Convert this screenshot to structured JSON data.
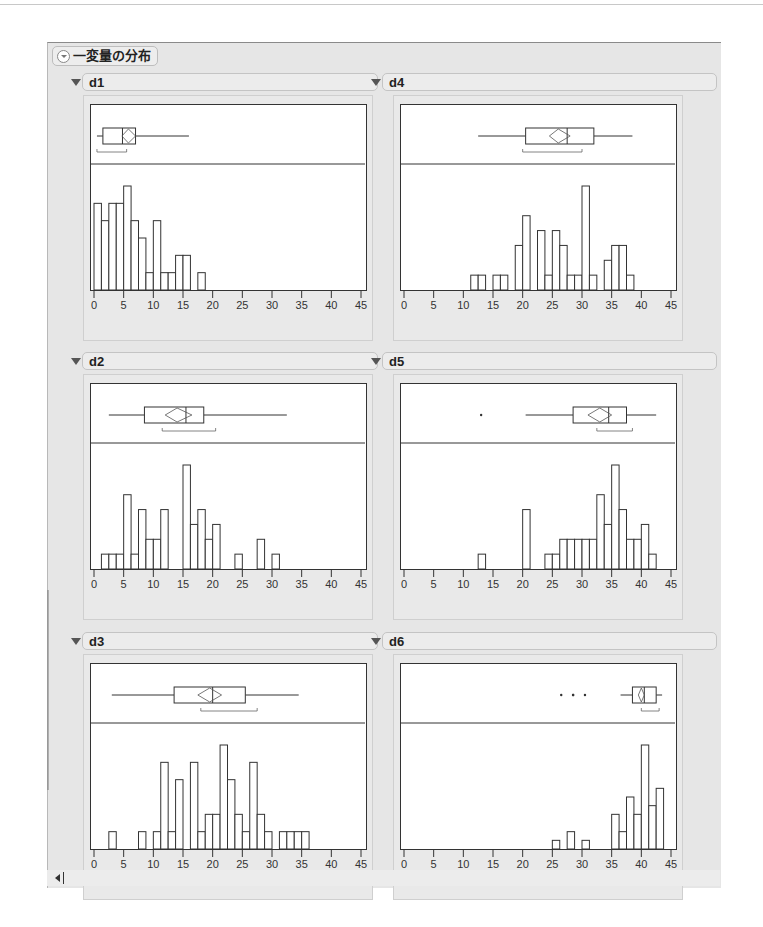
{
  "report": {
    "title": "一変量の分布"
  },
  "panels": [
    {
      "name": "d1",
      "col": 0,
      "row": 0
    },
    {
      "name": "d4",
      "col": 1,
      "row": 0
    },
    {
      "name": "d2",
      "col": 0,
      "row": 1
    },
    {
      "name": "d5",
      "col": 1,
      "row": 1
    },
    {
      "name": "d3",
      "col": 0,
      "row": 2
    },
    {
      "name": "d6",
      "col": 1,
      "row": 2
    }
  ],
  "chart_data": [
    {
      "type": "bar",
      "title": "d1",
      "xlabel": "",
      "ylabel": "",
      "xlim": [
        0,
        45
      ],
      "x_ticks": [
        0,
        5,
        10,
        15,
        20,
        25,
        30,
        35,
        40,
        45
      ],
      "bin_width": 1.25,
      "bin_start": 0,
      "values": [
        5,
        4,
        5,
        5,
        6,
        4,
        3,
        1,
        4,
        1,
        1,
        2,
        2,
        0,
        1
      ],
      "boxplot": {
        "min": 0.5,
        "q1": 1.5,
        "median": 4.8,
        "q3": 7.0,
        "max": 16,
        "mean": 5.8,
        "mean_ci": [
          4.7,
          7.0
        ],
        "shortest_half": [
          0.5,
          5.5
        ],
        "outliers": []
      },
      "grid": false,
      "legend": null
    },
    {
      "type": "bar",
      "title": "d4",
      "xlim": [
        0,
        45
      ],
      "x_ticks": [
        0,
        5,
        10,
        15,
        20,
        25,
        30,
        35,
        40,
        45
      ],
      "bin_width": 1.25,
      "bin_start": 11.25,
      "values": [
        1,
        1,
        0,
        1,
        1,
        0,
        3,
        5,
        0,
        4,
        1,
        4,
        3,
        1,
        1,
        7,
        1,
        0,
        2,
        3,
        3,
        1
      ],
      "boxplot": {
        "min": 12.5,
        "q1": 20.5,
        "median": 27.5,
        "q3": 32.0,
        "max": 38.5,
        "mean": 26.0,
        "mean_ci": [
          24.5,
          28.0
        ],
        "shortest_half": [
          20.0,
          30.0
        ],
        "outliers": []
      },
      "grid": false,
      "legend": null
    },
    {
      "type": "bar",
      "title": "d2",
      "xlim": [
        0,
        45
      ],
      "x_ticks": [
        0,
        5,
        10,
        15,
        20,
        25,
        30,
        35,
        40,
        45
      ],
      "bin_width": 1.25,
      "bin_start": 1.25,
      "values": [
        1,
        1,
        1,
        5,
        1,
        4,
        2,
        2,
        4,
        0,
        0,
        7,
        3,
        4,
        2,
        3,
        0,
        0,
        1,
        0,
        0,
        2,
        0,
        1
      ],
      "boxplot": {
        "min": 2.5,
        "q1": 8.5,
        "median": 15.5,
        "q3": 18.5,
        "max": 32.5,
        "mean": 14.0,
        "mean_ci": [
          12.0,
          16.5
        ],
        "shortest_half": [
          11.5,
          20.5
        ],
        "outliers": []
      },
      "grid": false,
      "legend": null
    },
    {
      "type": "bar",
      "title": "d5",
      "xlim": [
        0,
        45
      ],
      "x_ticks": [
        0,
        5,
        10,
        15,
        20,
        25,
        30,
        35,
        40,
        45
      ],
      "bin_width": 1.25,
      "bin_start": 12.5,
      "values": [
        1,
        0,
        0,
        0,
        0,
        0,
        4,
        0,
        0,
        1,
        1,
        2,
        2,
        2,
        2,
        2,
        5,
        3,
        7,
        4,
        2,
        2,
        3,
        1
      ],
      "boxplot": {
        "min": 20.5,
        "q1": 28.5,
        "median": 34.5,
        "q3": 37.5,
        "max": 42.5,
        "mean": 33.0,
        "mean_ci": [
          31.0,
          35.0
        ],
        "shortest_half": [
          32.5,
          38.5
        ],
        "outliers": [
          13.0
        ]
      },
      "grid": false,
      "legend": null
    },
    {
      "type": "bar",
      "title": "d3",
      "xlim": [
        0,
        45
      ],
      "x_ticks": [
        0,
        5,
        10,
        15,
        20,
        25,
        30,
        35,
        40,
        45
      ],
      "bin_width": 1.25,
      "bin_start": 2.5,
      "values": [
        1,
        0,
        0,
        0,
        1,
        0,
        1,
        5,
        1,
        4,
        0,
        5,
        1,
        2,
        2,
        6,
        4,
        2,
        1,
        5,
        2,
        1,
        0,
        1,
        1,
        1,
        1
      ],
      "boxplot": {
        "min": 3.0,
        "q1": 13.5,
        "median": 20.0,
        "q3": 25.5,
        "max": 34.5,
        "mean": 19.5,
        "mean_ci": [
          17.5,
          21.5
        ],
        "shortest_half": [
          18.0,
          27.5
        ],
        "outliers": []
      },
      "grid": false,
      "legend": null
    },
    {
      "type": "bar",
      "title": "d6",
      "xlim": [
        0,
        45
      ],
      "x_ticks": [
        0,
        5,
        10,
        15,
        20,
        25,
        30,
        35,
        40,
        45
      ],
      "bin_width": 1.25,
      "bin_start": 25,
      "values": [
        1,
        0,
        2,
        0,
        1,
        0,
        0,
        0,
        4,
        2,
        6,
        4,
        12,
        5,
        7
      ],
      "boxplot": {
        "min": 36.5,
        "q1": 38.5,
        "median": 40.5,
        "q3": 42.5,
        "max": 43.5,
        "mean": 40.0,
        "mean_ci": [
          39.5,
          40.5
        ],
        "shortest_half": [
          40.0,
          43.0
        ],
        "outliers": [
          26.5,
          28.5,
          28.5,
          30.5
        ]
      },
      "grid": false,
      "legend": null
    }
  ],
  "colors": {
    "background": "#e6e6e6",
    "plot_background": "#ffffff",
    "bar_fill": "#ffffff",
    "bar_stroke": "#333333",
    "box_mean_diamond": "#555555"
  }
}
